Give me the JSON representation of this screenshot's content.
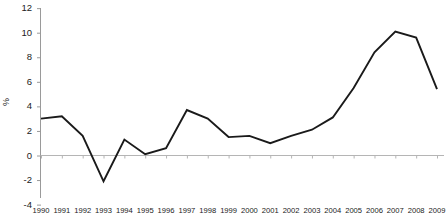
{
  "chart_data": {
    "type": "line",
    "title": "",
    "subtitle": "",
    "xlabel": "",
    "ylabel": "%",
    "ylim": [
      -4,
      12
    ],
    "yticks": [
      -4,
      -2,
      0,
      2,
      4,
      6,
      8,
      10,
      12
    ],
    "ytick_labels": [
      "-4",
      "-2",
      "0",
      "2",
      "4",
      "6",
      "8",
      "10",
      "12"
    ],
    "grid": false,
    "legend": null,
    "legend_position": "none",
    "categories": [
      "1990",
      "1991",
      "1992",
      "1993",
      "1994",
      "1995",
      "1996",
      "1997",
      "1998",
      "1999",
      "2000",
      "2001",
      "2002",
      "2003",
      "2004",
      "2005",
      "2006",
      "2007",
      "2008",
      "2009"
    ],
    "x": [
      1990,
      1991,
      1992,
      1993,
      1994,
      1995,
      1996,
      1997,
      1998,
      1999,
      2000,
      2001,
      2002,
      2003,
      2004,
      2005,
      2006,
      2007,
      2008,
      2009
    ],
    "values": [
      3.0,
      3.2,
      1.6,
      -2.1,
      1.3,
      0.1,
      0.6,
      3.7,
      3.0,
      1.5,
      1.6,
      1.0,
      1.6,
      2.1,
      3.1,
      5.5,
      8.4,
      10.1,
      9.6,
      5.4
    ],
    "series": [
      {
        "name": "",
        "color": "#1a1a1a",
        "values": [
          3.0,
          3.2,
          1.6,
          -2.1,
          1.3,
          0.1,
          0.6,
          3.7,
          3.0,
          1.5,
          1.6,
          1.0,
          1.6,
          2.1,
          3.1,
          5.5,
          8.4,
          10.1,
          9.6,
          5.4
        ]
      }
    ],
    "colors": {
      "line": "#1a1a1a",
      "axis": "#9a9a9a",
      "zero_line": "#b5b5b5",
      "text": "#222222",
      "background": "#ffffff"
    }
  }
}
